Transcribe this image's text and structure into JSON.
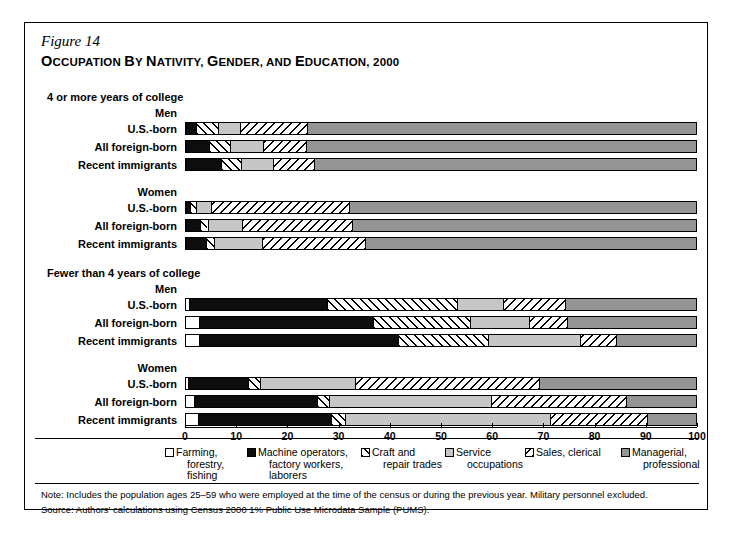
{
  "figure": {
    "number": "Figure 14",
    "title_parts": [
      {
        "t": "O",
        "big": true
      },
      {
        "t": "CCUPATION",
        "big": false
      },
      {
        "t": " ",
        "big": false
      },
      {
        "t": "B",
        "big": true
      },
      {
        "t": "Y",
        "big": false
      },
      {
        "t": " ",
        "big": false
      },
      {
        "t": "N",
        "big": true
      },
      {
        "t": "ATIVITY",
        "big": false
      },
      {
        "t": ", ",
        "big": false
      },
      {
        "t": "G",
        "big": true
      },
      {
        "t": "ENDER",
        "big": false
      },
      {
        "t": ", ",
        "big": false
      },
      {
        "t": "AND",
        "big": false
      },
      {
        "t": " ",
        "big": false
      },
      {
        "t": "E",
        "big": true
      },
      {
        "t": "DUCATION",
        "big": false
      },
      {
        "t": ", 2000",
        "big": false
      }
    ],
    "title_plain": "OCCUPATION BY NATIVITY, GENDER, AND EDUCATION, 2000"
  },
  "panels": [
    {
      "heading": "4 or more years of college",
      "groups": [
        {
          "label": "Men",
          "rows": [
            {
              "label": "U.S.-born",
              "values": [
                0.0,
                2.0,
                4.3,
                4.3,
                13.0,
                76.4
              ]
            },
            {
              "label": "All foreign-born",
              "values": [
                0.0,
                4.5,
                4.0,
                6.5,
                8.5,
                76.5
              ]
            },
            {
              "label": "Recent immigrants",
              "values": [
                0.0,
                6.8,
                4.0,
                6.2,
                8.0,
                75.0
              ]
            }
          ]
        },
        {
          "label": "Women",
          "rows": [
            {
              "label": "U.S.-born",
              "values": [
                0.0,
                0.8,
                1.2,
                2.8,
                27.0,
                68.2
              ]
            },
            {
              "label": "All foreign-born",
              "values": [
                0.0,
                2.8,
                1.4,
                6.8,
                21.5,
                67.5
              ]
            },
            {
              "label": "Recent immigrants",
              "values": [
                0.0,
                4.0,
                1.4,
                9.5,
                20.0,
                65.1
              ]
            }
          ]
        }
      ]
    },
    {
      "heading": "Fewer than 4 years of college",
      "groups": [
        {
          "label": "Men",
          "rows": [
            {
              "label": "U.S.-born",
              "values": [
                0.5,
                27.0,
                25.5,
                9.0,
                12.0,
                26.0
              ]
            },
            {
              "label": "All foreign-born",
              "values": [
                2.5,
                34.0,
                19.0,
                11.5,
                7.5,
                25.5
              ]
            },
            {
              "label": "Recent immigrants",
              "values": [
                2.5,
                39.0,
                17.5,
                18.0,
                7.0,
                16.0
              ]
            }
          ]
        },
        {
          "label": "Women",
          "rows": [
            {
              "label": "U.S.-born",
              "values": [
                0.3,
                11.8,
                2.4,
                18.5,
                36.0,
                31.0
              ]
            },
            {
              "label": "All foreign-born",
              "values": [
                1.5,
                24.0,
                2.5,
                31.5,
                26.5,
                14.0
              ]
            },
            {
              "label": "Recent immigrants",
              "values": [
                2.3,
                26.0,
                2.7,
                40.0,
                19.0,
                10.0
              ]
            }
          ]
        }
      ]
    }
  ],
  "axis": {
    "min": 0,
    "max": 100,
    "ticks": [
      "0",
      "10",
      "20",
      "30",
      "40",
      "50",
      "60",
      "70",
      "80",
      "90",
      "100"
    ]
  },
  "legend": {
    "items": [
      {
        "name": "farming",
        "fill": "f-farm",
        "lines": [
          "Farming,",
          "forestry,",
          "fishing"
        ]
      },
      {
        "name": "machine",
        "fill": "f-mach",
        "lines": [
          "Machine operators,",
          "factory workers,",
          "laborers"
        ]
      },
      {
        "name": "craft",
        "fill": "f-craft",
        "lines": [
          "Craft and",
          "repair trades"
        ]
      },
      {
        "name": "service",
        "fill": "f-serv",
        "lines": [
          "Service",
          "occupations"
        ]
      },
      {
        "name": "sales",
        "fill": "f-sales",
        "lines": [
          "Sales, clerical"
        ]
      },
      {
        "name": "managerial",
        "fill": "f-mgr",
        "lines": [
          "Managerial,",
          "professional"
        ]
      }
    ]
  },
  "footnotes": {
    "note": "Note: Includes the population ages 25–59 who were employed at the time of the census or during the previous year. Military personnel excluded.",
    "source": "Source: Authors' calculations using Census 2000 1% Public Use Microdata Sample (PUMS)."
  },
  "chart_data": {
    "type": "bar",
    "orientation": "horizontal",
    "stacked": true,
    "title": "OCCUPATION BY NATIVITY, GENDER, AND EDUCATION, 2000",
    "xlabel": "",
    "ylabel": "",
    "xlim": [
      0,
      100
    ],
    "grid": false,
    "legend_position": "bottom",
    "series": [
      {
        "name": "Farming, forestry, fishing"
      },
      {
        "name": "Machine operators, factory workers, laborers"
      },
      {
        "name": "Craft and repair trades"
      },
      {
        "name": "Service occupations"
      },
      {
        "name": "Sales, clerical"
      },
      {
        "name": "Managerial, professional"
      }
    ],
    "categories": [
      "4 or more years of college / Men / U.S.-born",
      "4 or more years of college / Men / All foreign-born",
      "4 or more years of college / Men / Recent immigrants",
      "4 or more years of college / Women / U.S.-born",
      "4 or more years of college / Women / All foreign-born",
      "4 or more years of college / Women / Recent immigrants",
      "Fewer than 4 years of college / Men / U.S.-born",
      "Fewer than 4 years of college / Men / All foreign-born",
      "Fewer than 4 years of college / Men / Recent immigrants",
      "Fewer than 4 years of college / Women / U.S.-born",
      "Fewer than 4 years of college / Women / All foreign-born",
      "Fewer than 4 years of college / Women / Recent immigrants"
    ],
    "values": [
      [
        0.0,
        2.0,
        4.3,
        4.3,
        13.0,
        76.4
      ],
      [
        0.0,
        4.5,
        4.0,
        6.5,
        8.5,
        76.5
      ],
      [
        0.0,
        6.8,
        4.0,
        6.2,
        8.0,
        75.0
      ],
      [
        0.0,
        0.8,
        1.2,
        2.8,
        27.0,
        68.2
      ],
      [
        0.0,
        2.8,
        1.4,
        6.8,
        21.5,
        67.5
      ],
      [
        0.0,
        4.0,
        1.4,
        9.5,
        20.0,
        65.1
      ],
      [
        0.5,
        27.0,
        25.5,
        9.0,
        12.0,
        26.0
      ],
      [
        2.5,
        34.0,
        19.0,
        11.5,
        7.5,
        25.5
      ],
      [
        2.5,
        39.0,
        17.5,
        18.0,
        7.0,
        16.0
      ],
      [
        0.3,
        11.8,
        2.4,
        18.5,
        36.0,
        31.0
      ],
      [
        1.5,
        24.0,
        2.5,
        31.5,
        26.5,
        14.0
      ],
      [
        2.3,
        26.0,
        2.7,
        40.0,
        19.0,
        10.0
      ]
    ],
    "units": "percent"
  }
}
